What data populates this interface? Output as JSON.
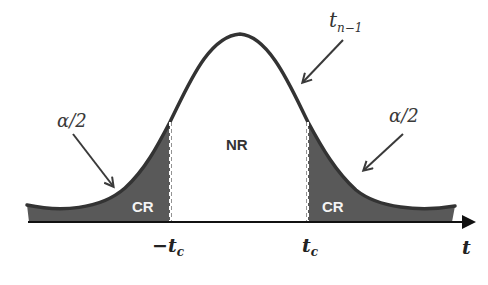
{
  "diagram": {
    "distribution_label": {
      "base": "t",
      "subscript": "n−1"
    },
    "regions": {
      "left_critical": "CR",
      "non_rejection": "NR",
      "right_critical": "CR"
    },
    "tail_annotations": {
      "left": "α/2",
      "right": "α/2"
    },
    "axis": {
      "label": "t",
      "ticks": [
        {
          "prefix": "−",
          "base": "t",
          "subscript": "c"
        },
        {
          "prefix": "",
          "base": "t",
          "subscript": "c"
        }
      ]
    },
    "colors": {
      "curve": "#333333",
      "critical_fill": "#595959",
      "axis": "#111111",
      "background": "#ffffff"
    }
  }
}
